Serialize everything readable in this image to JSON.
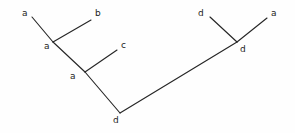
{
  "figure": {
    "name": "labeled-line-diagram",
    "width": 295,
    "height": 133,
    "background_color": "#fefefe",
    "stroke_color": "#262626",
    "label_color": "#1c1c1c",
    "stroke_width": 1.15,
    "label_font_size": 9
  },
  "chart_data": {
    "type": "diagram",
    "title": "",
    "xlabel": "",
    "ylabel": "",
    "grid": false,
    "legend": null,
    "axis_ranges": {
      "x": [
        0,
        295
      ],
      "y": [
        0,
        133
      ]
    },
    "nodes": [
      {
        "id": "n1",
        "label": "a",
        "kind": "leaf",
        "x": 32,
        "y": 17
      },
      {
        "id": "n2",
        "label": "b",
        "kind": "leaf",
        "x": 91,
        "y": 20
      },
      {
        "id": "n3",
        "label": "c",
        "kind": "leaf",
        "x": 117,
        "y": 50
      },
      {
        "id": "n4",
        "label": "d",
        "kind": "leaf",
        "x": 210,
        "y": 17
      },
      {
        "id": "n5",
        "label": "a",
        "kind": "leaf",
        "x": 267,
        "y": 18
      },
      {
        "id": "j1",
        "label": "a",
        "kind": "junction",
        "x": 53,
        "y": 42
      },
      {
        "id": "j2",
        "label": "a",
        "kind": "junction",
        "x": 85,
        "y": 72
      },
      {
        "id": "j3",
        "label": "d",
        "kind": "junction",
        "x": 120,
        "y": 113
      },
      {
        "id": "j4",
        "label": "d",
        "kind": "junction",
        "x": 237,
        "y": 42
      }
    ],
    "edges": [
      {
        "id": "e1",
        "from": "n1",
        "to": "j1",
        "x1": 32,
        "y1": 17,
        "x2": 53,
        "y2": 42
      },
      {
        "id": "e2",
        "from": "j1",
        "to": "n2",
        "x1": 53,
        "y1": 42,
        "x2": 91,
        "y2": 20
      },
      {
        "id": "e3",
        "from": "j1",
        "to": "j2",
        "x1": 53,
        "y1": 42,
        "x2": 85,
        "y2": 72
      },
      {
        "id": "e4",
        "from": "j2",
        "to": "n3",
        "x1": 85,
        "y1": 72,
        "x2": 117,
        "y2": 50
      },
      {
        "id": "e5",
        "from": "j2",
        "to": "j3",
        "x1": 85,
        "y1": 72,
        "x2": 120,
        "y2": 113
      },
      {
        "id": "e6",
        "from": "j3",
        "to": "j4",
        "x1": 120,
        "y1": 113,
        "x2": 237,
        "y2": 42
      },
      {
        "id": "e7",
        "from": "j4",
        "to": "n4",
        "x1": 237,
        "y1": 42,
        "x2": 210,
        "y2": 17
      },
      {
        "id": "e8",
        "from": "j4",
        "to": "n5",
        "x1": 237,
        "y1": 42,
        "x2": 267,
        "y2": 18
      }
    ],
    "labels": [
      {
        "id": "lbl-n1",
        "text": "a",
        "x": 22,
        "y": 9
      },
      {
        "id": "lbl-n2",
        "text": "b",
        "x": 95,
        "y": 9
      },
      {
        "id": "lbl-n3",
        "text": "c",
        "x": 121,
        "y": 41
      },
      {
        "id": "lbl-n4",
        "text": "d",
        "x": 198,
        "y": 9
      },
      {
        "id": "lbl-n5",
        "text": "a",
        "x": 271,
        "y": 9
      },
      {
        "id": "lbl-j1",
        "text": "a",
        "x": 44,
        "y": 42
      },
      {
        "id": "lbl-j2",
        "text": "a",
        "x": 70,
        "y": 72
      },
      {
        "id": "lbl-j3",
        "text": "d",
        "x": 113,
        "y": 116
      },
      {
        "id": "lbl-j4",
        "text": "d",
        "x": 240,
        "y": 45
      }
    ]
  }
}
